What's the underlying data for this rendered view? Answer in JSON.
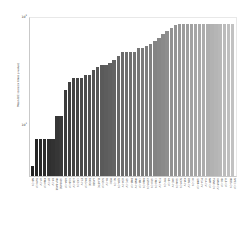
{
  "chart_data": {
    "type": "bar",
    "title": "",
    "xlabel": "",
    "ylabel": "Mean BIC score (x times p-value)",
    "yscale": "log",
    "ylim": [
      1,
      120
    ],
    "grid": false,
    "legend": null,
    "yticks": [
      "10¹",
      "10²"
    ],
    "ytick_top": "10",
    "ytick_top_exp": "2",
    "ytick_bottom": "10",
    "ytick_bottom_exp": "1",
    "colormap": "grayscale-dark-to-light",
    "categories": [
      "NB-CV",
      "SVM-CV",
      "LR-CV",
      "KNN-CV",
      "DT-CV",
      "RF-CV",
      "MLP-BASE",
      "GB-BASE",
      "ADA-CV",
      "XGB-CV",
      "LGB-CV",
      "CAT-CV",
      "ET-CV",
      "BAG-CV",
      "RIDGE",
      "LASSO",
      "ELASTIC",
      "SGD-CV",
      "PA-CV",
      "PERC",
      "NC-CV",
      "QDA-CV",
      "LDA-CV",
      "GPC-CV",
      "BNB-CV",
      "MNB-CV",
      "CNB-CV",
      "RNN-CV",
      "LSTM-CV",
      "GRU-CV",
      "CNN-CV",
      "TCN-CV",
      "TRF-CV",
      "AE-CV",
      "VAE-CV",
      "GAN-CV",
      "SOM-CV",
      "KM-CV",
      "DBS-CV",
      "HC-CV",
      "GMM-CV",
      "PCA-CV",
      "ICA-CV",
      "NMF-CV",
      "TSNE-CV",
      "UMAP-CV",
      "ISO-CV",
      "LLE-CV",
      "MDS-CV",
      "SPEC-CV"
    ],
    "values": [
      1.35,
      3.1,
      3.1,
      3.1,
      3.1,
      3.1,
      6.2,
      6.2,
      13.5,
      17.5,
      19.5,
      19.5,
      19.5,
      21.5,
      21.5,
      24.5,
      27.0,
      28.5,
      28.5,
      31.0,
      33.5,
      38.5,
      43.5,
      43.5,
      43.5,
      43.5,
      48.0,
      48.0,
      52.0,
      55.0,
      60.0,
      66.0,
      73.0,
      80.0,
      88.0,
      96.0,
      100.0,
      100.0,
      100.0,
      100.0,
      100.0,
      100.0,
      100.0,
      100.0,
      100.0,
      100.0,
      100.0,
      100.0,
      100.0,
      100.0
    ]
  }
}
